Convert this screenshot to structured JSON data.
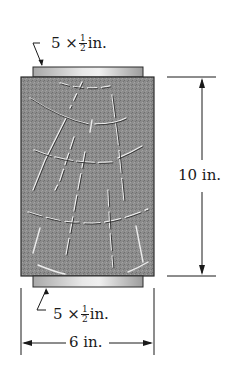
{
  "diagram": {
    "type": "engineering-figure",
    "top_plate_label": {
      "whole": "5",
      "times": "×",
      "num": "1",
      "den": "2",
      "unit": "in."
    },
    "bottom_plate_label": {
      "whole": "5",
      "times": "×",
      "num": "1",
      "den": "2",
      "unit": "in."
    },
    "height_dimension": "10 in.",
    "width_dimension": "6 in.",
    "colors": {
      "block_fill": "#8a8a8a",
      "block_border": "#2a2a2a",
      "plate_light": "#e4e4e4",
      "plate_dark": "#9a9a9a",
      "crack_light": "#eeeeee",
      "crack_dark": "#333333",
      "line": "#1a1a1a"
    }
  }
}
